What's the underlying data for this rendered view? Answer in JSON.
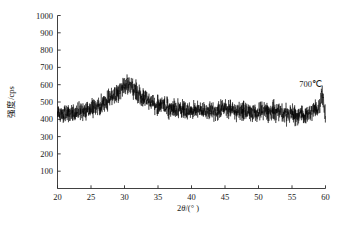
{
  "figure": {
    "name": "xrd-pattern-700c",
    "background_color": "#ffffff",
    "line_color": "#000000",
    "axis_color": "#2b2b2b"
  },
  "annotation": {
    "sample_label": "700℃"
  },
  "axes": {
    "x_title_main": "2",
    "x_title_italic": "θ",
    "x_title_unit": "/(° )",
    "y_title": "强度/cps"
  },
  "chart_data": {
    "type": "line",
    "title": "",
    "subtitle": "",
    "xlabel": "2θ/(°)",
    "ylabel": "强度/cps",
    "xlim": [
      20,
      60
    ],
    "ylim": [
      0,
      1000
    ],
    "xticks": [
      20,
      25,
      30,
      35,
      40,
      45,
      50,
      55,
      60
    ],
    "xticklabels": [
      "20",
      "25",
      "30",
      "35",
      "40",
      "45",
      "50",
      "55",
      "60"
    ],
    "yticks": [
      100,
      200,
      300,
      400,
      500,
      600,
      700,
      800,
      900,
      1000
    ],
    "yticklabels": [
      "100",
      "200",
      "300",
      "400",
      "500",
      "600",
      "700",
      "800",
      "900",
      "1000"
    ],
    "grid": false,
    "legend": null,
    "frame": "left-bottom-only",
    "annotations": [
      {
        "text": "700℃",
        "x": 55.5,
        "y": 690
      }
    ],
    "series": [
      {
        "name": "700℃ XRD intensity",
        "color": "#000000",
        "description": "Noisy X-ray diffraction trace with a broad amorphous hump centred near 2-theta = 30.7 degrees",
        "baseline_x": [
          20,
          22,
          24,
          26,
          28,
          30.7,
          33,
          35,
          37,
          40,
          43,
          45,
          47,
          50,
          52,
          55,
          57,
          59.4,
          60
        ],
        "baseline_y": [
          432,
          438,
          448,
          470,
          530,
          600,
          520,
          478,
          462,
          452,
          448,
          458,
          448,
          438,
          448,
          430,
          425,
          470,
          420
        ],
        "noise_amplitude": 48,
        "peaks": [
          {
            "center": 30.7,
            "height": 600,
            "width": 4.6,
            "type": "broad-amorphous-hump"
          },
          {
            "center": 45.2,
            "height": 462,
            "width": 2.2,
            "type": "weak-bump"
          },
          {
            "center": 52.1,
            "height": 452,
            "width": 2.0,
            "type": "weak-bump"
          },
          {
            "center": 59.5,
            "height": 505,
            "width": 0.25,
            "type": "narrow-spike"
          }
        ],
        "y_min_observed": 345,
        "y_max_observed": 648
      }
    ]
  }
}
